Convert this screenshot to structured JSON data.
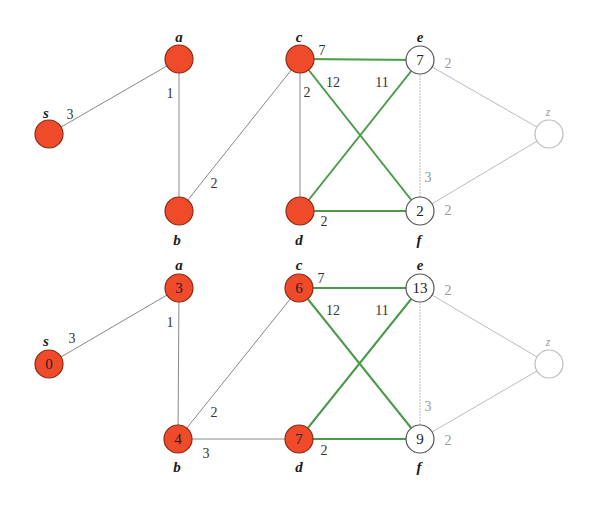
{
  "figure": {
    "colors": {
      "visited_fill": "#ef4a2a",
      "visited_stroke": "#8a2a14",
      "unvisited_fill": "#ffffff",
      "unvisited_stroke": "#555555",
      "faint_stroke": "#bbbbbb",
      "tree_edge": "#4a9a4a",
      "plain_edge": "#888888"
    },
    "panels": [
      {
        "name": "top",
        "nodes": [
          {
            "id": "s",
            "label": "s",
            "x": 49,
            "y": 134,
            "value": "",
            "state": "visited",
            "lx": 46,
            "ly": 118
          },
          {
            "id": "a",
            "label": "a",
            "x": 179,
            "y": 59,
            "value": "",
            "state": "visited",
            "lx": 179,
            "ly": 42
          },
          {
            "id": "b",
            "label": "b",
            "x": 179,
            "y": 211,
            "value": "",
            "state": "visited",
            "lx": 177,
            "ly": 245
          },
          {
            "id": "c",
            "label": "c",
            "x": 300,
            "y": 59,
            "value": "",
            "state": "visited",
            "lx": 299,
            "ly": 42
          },
          {
            "id": "d",
            "label": "d",
            "x": 300,
            "y": 211,
            "value": "",
            "state": "visited",
            "lx": 299,
            "ly": 245
          },
          {
            "id": "e",
            "label": "e",
            "x": 420,
            "y": 60,
            "value": "7",
            "state": "open",
            "lx": 420,
            "ly": 42
          },
          {
            "id": "f",
            "label": "f",
            "x": 420,
            "y": 211,
            "value": "2",
            "state": "open",
            "lx": 419,
            "ly": 245
          },
          {
            "id": "z",
            "label": "z",
            "x": 549,
            "y": 134,
            "value": "",
            "state": "faint",
            "lx": 548,
            "ly": 116
          }
        ],
        "edges": [
          {
            "from": "s",
            "to": "a",
            "weight": "3",
            "style": "plain",
            "wx": 70,
            "wy": 119
          },
          {
            "from": "a",
            "to": "b",
            "weight": "1",
            "style": "plain",
            "wx": 170,
            "wy": 98
          },
          {
            "from": "b",
            "to": "c",
            "weight": "2",
            "style": "plain",
            "wx": 214,
            "wy": 188
          },
          {
            "from": "c",
            "to": "d",
            "weight": "2",
            "style": "plain",
            "wx": 307,
            "wy": 97
          },
          {
            "from": "c",
            "to": "e",
            "weight": "7",
            "style": "tree",
            "wx": 322,
            "wy": 55
          },
          {
            "from": "c",
            "to": "f",
            "weight": "12",
            "style": "tree",
            "wx": 333,
            "wy": 87
          },
          {
            "from": "d",
            "to": "e",
            "weight": "11",
            "style": "tree",
            "wx": 382,
            "wy": 87
          },
          {
            "from": "d",
            "to": "f",
            "weight": "2",
            "style": "tree",
            "wx": 324,
            "wy": 226
          },
          {
            "from": "e",
            "to": "f",
            "weight": "3",
            "style": "faint",
            "wx": 428,
            "wy": 182
          },
          {
            "from": "e",
            "to": "z",
            "weight": "2",
            "style": "faint",
            "wx": 448,
            "wy": 68
          },
          {
            "from": "f",
            "to": "z",
            "weight": "2",
            "style": "faint",
            "wx": 448,
            "wy": 215
          }
        ]
      },
      {
        "name": "bottom",
        "nodes": [
          {
            "id": "s",
            "label": "s",
            "x": 49,
            "y": 364,
            "value": "0",
            "state": "visited",
            "lx": 46,
            "ly": 346
          },
          {
            "id": "a",
            "label": "a",
            "x": 179,
            "y": 288,
            "value": "3",
            "state": "visited",
            "lx": 179,
            "ly": 270
          },
          {
            "id": "b",
            "label": "b",
            "x": 178,
            "y": 439,
            "value": "4",
            "state": "visited",
            "lx": 177,
            "ly": 472
          },
          {
            "id": "c",
            "label": "c",
            "x": 299,
            "y": 288,
            "value": "6",
            "state": "visited",
            "lx": 299,
            "ly": 270
          },
          {
            "id": "d",
            "label": "d",
            "x": 299,
            "y": 439,
            "value": "7",
            "state": "visited",
            "lx": 299,
            "ly": 472
          },
          {
            "id": "e",
            "label": "e",
            "x": 420,
            "y": 288,
            "value": "13",
            "state": "open",
            "lx": 420,
            "ly": 270
          },
          {
            "id": "f",
            "label": "f",
            "x": 420,
            "y": 439,
            "value": "9",
            "state": "open",
            "lx": 419,
            "ly": 472
          },
          {
            "id": "z",
            "label": "z",
            "x": 549,
            "y": 364,
            "value": "",
            "state": "faint",
            "lx": 548,
            "ly": 346
          }
        ],
        "edges": [
          {
            "from": "s",
            "to": "a",
            "weight": "3",
            "style": "plain",
            "wx": 72,
            "wy": 343
          },
          {
            "from": "a",
            "to": "b",
            "weight": "1",
            "style": "plain",
            "wx": 170,
            "wy": 327
          },
          {
            "from": "b",
            "to": "c",
            "weight": "2",
            "style": "plain",
            "wx": 214,
            "wy": 417
          },
          {
            "from": "b",
            "to": "d",
            "weight": "3",
            "style": "plain",
            "wx": 206,
            "wy": 458
          },
          {
            "from": "c",
            "to": "e",
            "weight": "7",
            "style": "tree",
            "wx": 321,
            "wy": 283
          },
          {
            "from": "c",
            "to": "f",
            "weight": "12",
            "style": "tree",
            "wx": 333,
            "wy": 315
          },
          {
            "from": "d",
            "to": "e",
            "weight": "11",
            "style": "tree",
            "wx": 382,
            "wy": 315
          },
          {
            "from": "d",
            "to": "f",
            "weight": "2",
            "style": "tree",
            "wx": 324,
            "wy": 455
          },
          {
            "from": "e",
            "to": "f",
            "weight": "3",
            "style": "faint",
            "wx": 428,
            "wy": 411
          },
          {
            "from": "e",
            "to": "z",
            "weight": "2",
            "style": "faint",
            "wx": 448,
            "wy": 295
          },
          {
            "from": "f",
            "to": "z",
            "weight": "2",
            "style": "faint",
            "wx": 448,
            "wy": 445
          }
        ]
      }
    ]
  }
}
